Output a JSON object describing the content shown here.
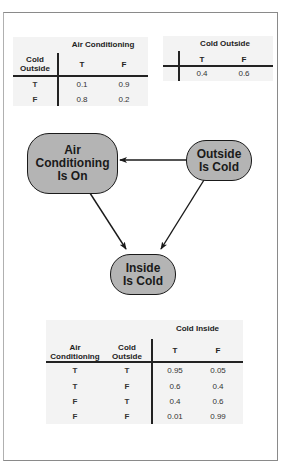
{
  "diagram": {
    "type": "bayesian-network",
    "nodes": [
      {
        "id": "ac",
        "label_lines": [
          "Air",
          "Conditioning",
          "Is On"
        ]
      },
      {
        "id": "outside",
        "label_lines": [
          "Outside",
          "Is Cold"
        ]
      },
      {
        "id": "inside",
        "label_lines": [
          "Inside",
          "Is Cold"
        ]
      }
    ],
    "edges": [
      {
        "from": "outside",
        "to": "ac"
      },
      {
        "from": "ac",
        "to": "inside"
      },
      {
        "from": "outside",
        "to": "inside"
      }
    ],
    "node_fill": "#b4b4b4",
    "node_border": "#1a1a1a"
  },
  "tables": {
    "ac_table": {
      "column_group_header": "Air Conditioning",
      "row_header_lines": [
        "Cold",
        "Outside"
      ],
      "columns": [
        "T",
        "F"
      ],
      "rows": [
        {
          "condition": "T",
          "values": [
            "0.1",
            "0.9"
          ]
        },
        {
          "condition": "F",
          "values": [
            "0.8",
            "0.2"
          ]
        }
      ]
    },
    "outside_table": {
      "column_group_header": "Cold Outside",
      "columns": [
        "T",
        "F"
      ],
      "values": [
        "0.4",
        "0.6"
      ]
    },
    "inside_table": {
      "column_group_header": "Cold Inside",
      "row_headers": [
        {
          "lines": [
            "Air",
            "Conditioning"
          ]
        },
        {
          "lines": [
            "Cold",
            "Outside"
          ]
        }
      ],
      "columns": [
        "T",
        "F"
      ],
      "rows": [
        {
          "conditions": [
            "T",
            "T"
          ],
          "values": [
            "0.95",
            "0.05"
          ]
        },
        {
          "conditions": [
            "T",
            "F"
          ],
          "values": [
            "0.6",
            "0.4"
          ]
        },
        {
          "conditions": [
            "F",
            "T"
          ],
          "values": [
            "0.4",
            "0.6"
          ]
        },
        {
          "conditions": [
            "F",
            "F"
          ],
          "values": [
            "0.01",
            "0.99"
          ]
        }
      ]
    }
  }
}
